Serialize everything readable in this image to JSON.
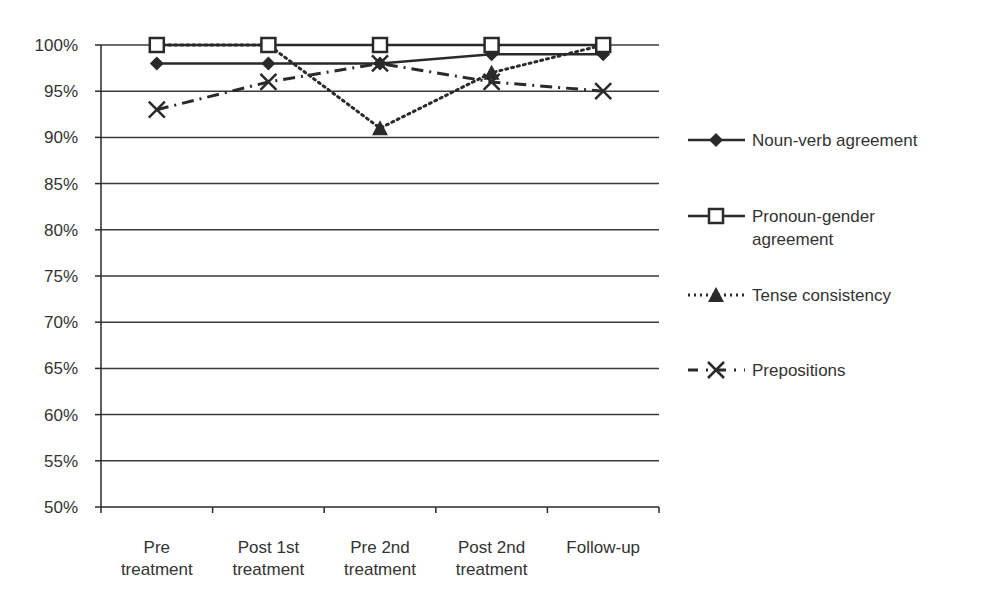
{
  "chart_data": {
    "type": "line",
    "title": "",
    "xlabel": "",
    "ylabel": "",
    "categories": [
      [
        "Pre",
        "treatment"
      ],
      [
        "Post 1st",
        "treatment"
      ],
      [
        "Pre 2nd",
        "treatment"
      ],
      [
        "Post 2nd",
        "treatment"
      ],
      [
        "Follow-up"
      ]
    ],
    "category_names": [
      "Pre treatment",
      "Post 1st treatment",
      "Pre 2nd treatment",
      "Post 2nd treatment",
      "Follow-up"
    ],
    "ylim": [
      50,
      100
    ],
    "yticks": [
      "50%",
      "55%",
      "60%",
      "65%",
      "70%",
      "75%",
      "80%",
      "85%",
      "90%",
      "95%",
      "100%"
    ],
    "grid": true,
    "legend_position": "right",
    "series": [
      {
        "name": "Noun-verb agreement",
        "legend_lines": [
          "Noun-verb agreement"
        ],
        "marker": "diamond",
        "line": "solid",
        "values": [
          98,
          98,
          98,
          99,
          99
        ]
      },
      {
        "name": "Pronoun-gender agreement",
        "legend_lines": [
          "Pronoun-gender",
          "agreement"
        ],
        "marker": "square-open",
        "line": "solid",
        "values": [
          100,
          100,
          100,
          100,
          100
        ]
      },
      {
        "name": "Tense consistency",
        "legend_lines": [
          "Tense consistency"
        ],
        "marker": "triangle",
        "line": "dotted",
        "values": [
          100,
          100,
          91,
          97,
          100
        ]
      },
      {
        "name": "Prepositions",
        "legend_lines": [
          "Prepositions"
        ],
        "marker": "x",
        "line": "dashdot",
        "values": [
          93,
          96,
          98,
          96,
          95
        ]
      }
    ]
  },
  "colors": {
    "line": "#2a2a2a",
    "grid": "#3a3a3a",
    "text": "#333333"
  }
}
